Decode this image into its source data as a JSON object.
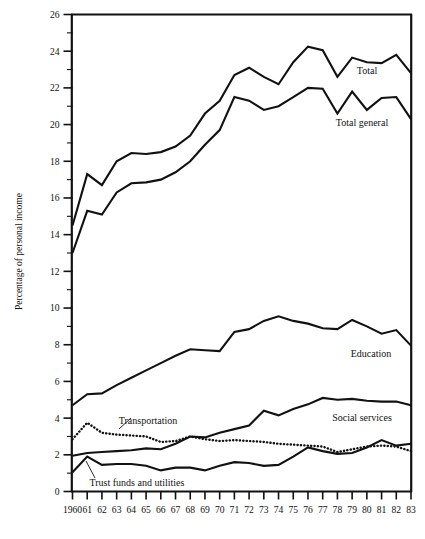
{
  "chart_data": {
    "type": "line",
    "title": "",
    "subtitle": "",
    "xlabel": "",
    "ylabel": "Percentage of personal income",
    "xlim": [
      1960,
      1983
    ],
    "ylim": [
      0,
      26
    ],
    "y_major_step": 2,
    "y_minor_step": 1,
    "grid": false,
    "legend_position": "inline-right",
    "x": [
      1960,
      1961,
      1962,
      1963,
      1964,
      1965,
      1966,
      1967,
      1968,
      1969,
      1970,
      1971,
      1972,
      1973,
      1974,
      1975,
      1976,
      1977,
      1978,
      1979,
      1980,
      1981,
      1982,
      1983
    ],
    "x_tick_labels": [
      "1960",
      "61",
      "62",
      "63",
      "64",
      "65",
      "66",
      "67",
      "68",
      "69",
      "70",
      "71",
      "72",
      "73",
      "74",
      "75",
      "76",
      "77",
      "78",
      "79",
      "80",
      "81",
      "82",
      "83"
    ],
    "y_tick_labels": [
      "0",
      "2",
      "4",
      "6",
      "8",
      "10",
      "12",
      "14",
      "16",
      "18",
      "20",
      "22",
      "24",
      "26"
    ],
    "y_ticks": [
      0,
      2,
      4,
      6,
      8,
      10,
      12,
      14,
      16,
      18,
      20,
      22,
      24,
      26
    ],
    "series": [
      {
        "name": "Total",
        "style": "solid",
        "label": "Total",
        "values": [
          14.5,
          17.3,
          16.7,
          18.0,
          18.45,
          18.4,
          18.5,
          18.8,
          19.4,
          20.6,
          21.3,
          22.7,
          23.1,
          22.6,
          22.2,
          23.4,
          24.25,
          24.05,
          22.6,
          23.65,
          23.4,
          23.35,
          23.8,
          22.8
        ]
      },
      {
        "name": "Total general",
        "style": "solid",
        "label": "Total general",
        "values": [
          13.0,
          15.3,
          15.1,
          16.3,
          16.8,
          16.85,
          17.0,
          17.4,
          18.0,
          18.9,
          19.7,
          21.5,
          21.3,
          20.8,
          21.0,
          21.5,
          22.0,
          21.95,
          20.6,
          21.8,
          20.8,
          21.45,
          21.5,
          20.3
        ]
      },
      {
        "name": "Education",
        "style": "solid",
        "label": "Education",
        "values": [
          4.7,
          5.3,
          5.35,
          5.8,
          6.2,
          6.6,
          7.0,
          7.4,
          7.75,
          7.7,
          7.65,
          8.7,
          8.85,
          9.3,
          9.55,
          9.3,
          9.15,
          8.9,
          8.85,
          9.35,
          9.0,
          8.6,
          8.8,
          7.95
        ]
      },
      {
        "name": "Social services",
        "style": "solid",
        "label": "Social services",
        "values": [
          1.95,
          2.1,
          2.15,
          2.2,
          2.25,
          2.35,
          2.3,
          2.6,
          3.0,
          2.95,
          3.2,
          3.4,
          3.6,
          4.4,
          4.15,
          4.5,
          4.75,
          5.1,
          5.0,
          5.05,
          4.95,
          4.9,
          4.9,
          4.7
        ]
      },
      {
        "name": "Transportation",
        "style": "dotted",
        "label": "Transportation",
        "values": [
          2.85,
          3.75,
          3.2,
          3.1,
          3.05,
          3.0,
          2.7,
          2.75,
          3.0,
          2.85,
          2.75,
          2.8,
          2.75,
          2.7,
          2.6,
          2.55,
          2.5,
          2.45,
          2.15,
          2.3,
          2.45,
          2.5,
          2.45,
          2.2
        ]
      },
      {
        "name": "Trust funds and utilities",
        "style": "solid",
        "label": "Trust funds and utilities",
        "values": [
          1.05,
          1.9,
          1.45,
          1.5,
          1.5,
          1.4,
          1.15,
          1.3,
          1.3,
          1.15,
          1.4,
          1.6,
          1.55,
          1.4,
          1.45,
          1.9,
          2.4,
          2.2,
          2.05,
          2.1,
          2.4,
          2.8,
          2.5,
          2.6
        ]
      }
    ],
    "annotations": [
      {
        "text": "Total",
        "for": "Total"
      },
      {
        "text": "Total general",
        "for": "Total general"
      },
      {
        "text": "Education",
        "for": "Education"
      },
      {
        "text": "Social services",
        "for": "Social services"
      },
      {
        "text": "Transportation",
        "for": "Transportation"
      },
      {
        "text": "Trust funds and utilities",
        "for": "Trust funds and utilities"
      }
    ]
  }
}
